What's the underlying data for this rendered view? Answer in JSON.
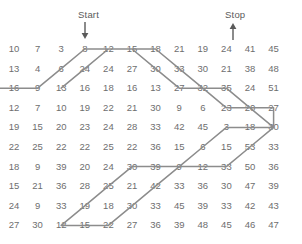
{
  "annotations": {
    "start_label": "Start",
    "stop_label": "Stop",
    "start_icon": "arrow-down-icon",
    "stop_icon": "arrow-up-icon",
    "start_column": 3,
    "stop_column": 10
  },
  "colors": {
    "number_text": "#6e6e6e",
    "label_text": "#5a5a5a",
    "path_line": "#8c8c8c",
    "background": "#ffffff"
  },
  "chart_data": {
    "type": "table",
    "title": "",
    "xlabel": "",
    "ylabel": "",
    "rows": 10,
    "columns": 12,
    "grid": [
      [
        10,
        7,
        3,
        8,
        12,
        15,
        18,
        21,
        19,
        24,
        41,
        45
      ],
      [
        13,
        4,
        6,
        24,
        24,
        27,
        30,
        33,
        30,
        21,
        38,
        48
      ],
      [
        16,
        9,
        13,
        16,
        18,
        16,
        13,
        27,
        32,
        35,
        24,
        51
      ],
      [
        12,
        7,
        10,
        19,
        22,
        21,
        30,
        9,
        6,
        23,
        20,
        27
      ],
      [
        19,
        15,
        20,
        23,
        24,
        28,
        33,
        42,
        45,
        3,
        18,
        30
      ],
      [
        22,
        25,
        22,
        22,
        25,
        22,
        36,
        15,
        6,
        15,
        53,
        33
      ],
      [
        18,
        9,
        39,
        20,
        24,
        30,
        39,
        9,
        12,
        33,
        50,
        36
      ],
      [
        15,
        21,
        36,
        28,
        25,
        21,
        42,
        33,
        36,
        30,
        47,
        39
      ],
      [
        24,
        9,
        33,
        19,
        18,
        30,
        33,
        45,
        39,
        33,
        42,
        43
      ],
      [
        27,
        30,
        12,
        15,
        22,
        27,
        36,
        39,
        48,
        45,
        46,
        47
      ]
    ],
    "path_description": "Gray polyline route from Start arrow (row1,col3) down to row2, then zigzag across the grid to Stop arrow (row1,col10)",
    "path_points": [
      [
        3,
        0
      ],
      [
        3,
        2
      ],
      [
        2,
        3
      ],
      [
        1,
        4
      ],
      [
        1,
        6
      ],
      [
        2,
        7
      ],
      [
        3,
        8
      ],
      [
        3,
        10
      ],
      [
        4,
        11
      ],
      [
        5,
        12
      ],
      [
        5,
        10
      ],
      [
        6,
        9
      ],
      [
        7,
        8
      ],
      [
        7,
        6
      ],
      [
        8,
        5
      ],
      [
        9,
        4
      ],
      [
        10,
        3
      ],
      [
        10,
        5
      ],
      [
        9,
        6
      ],
      [
        8,
        7
      ],
      [
        7,
        8
      ],
      [
        7,
        10
      ],
      [
        6,
        11
      ],
      [
        5,
        12
      ],
      [
        4,
        12
      ],
      [
        4,
        10
      ],
      [
        3,
        9
      ],
      [
        2,
        8
      ],
      [
        1,
        7
      ],
      [
        1,
        5
      ],
      [
        2,
        4
      ],
      [
        3,
        3
      ]
    ]
  }
}
